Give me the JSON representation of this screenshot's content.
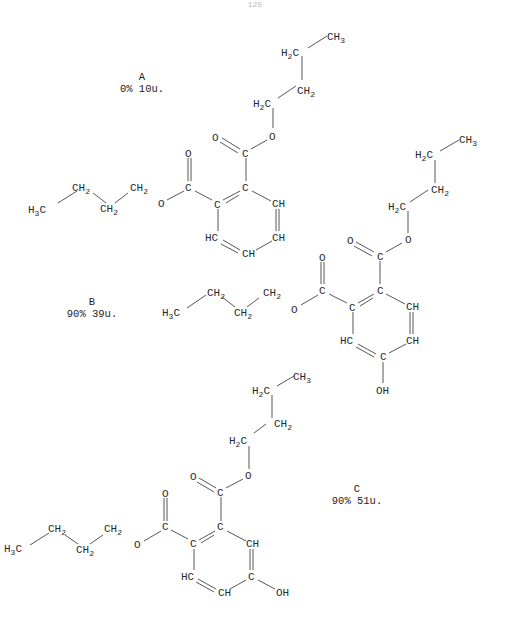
{
  "page_number": "125",
  "compounds": [
    {
      "id": "A",
      "title": "A",
      "caption": "0% 10u.",
      "substituent": "none",
      "atoms": {
        "c_ch3": "CH3",
        "c_h2c_a": "H2C",
        "c_ch2_a": "CH2",
        "c_h2c_b": "H2C",
        "c_o": "O",
        "c_carb": "C",
        "c_carb_o": "O",
        "r1": "C",
        "r2": "C",
        "r3": "CH",
        "r4": "CH",
        "r5": "CH",
        "r6": "HC",
        "l_carb": "C",
        "l_carb_o": "O",
        "l_o": "O",
        "l_ch2_a": "CH2",
        "l_ch2_b": "CH2",
        "l_ch2_c": "CH2",
        "l_ch3": "H3C"
      }
    },
    {
      "id": "B",
      "title": "B",
      "caption": "90% 39u.",
      "substituent": "OH (para to left ester, position 4)",
      "atoms": {
        "c_ch3": "CH3",
        "c_h2c_a": "H2C",
        "c_ch2_a": "CH2",
        "c_h2c_b": "H2C",
        "c_o": "O",
        "c_carb": "C",
        "c_carb_o": "O",
        "r1": "C",
        "r2": "C",
        "r3": "CH",
        "r4": "CH",
        "r5": "C",
        "r6": "HC",
        "oh": "OH",
        "l_carb": "C",
        "l_carb_o": "O",
        "l_o": "O",
        "l_ch2_a": "CH2",
        "l_ch2_b": "CH2",
        "l_ch2_c": "CH2",
        "l_ch3": "H3C"
      }
    },
    {
      "id": "C",
      "title": "C",
      "caption": "90% 51u.",
      "substituent": "OH (position 5)",
      "atoms": {
        "c_ch3": "CH3",
        "c_h2c_a": "H2C",
        "c_ch2_a": "CH2",
        "c_h2c_b": "H2C",
        "c_o": "O",
        "c_carb": "C",
        "c_carb_o": "O",
        "r1": "C",
        "r2": "C",
        "r3": "CH",
        "r4": "C",
        "r5": "CH",
        "r6": "HC",
        "oh": "OH",
        "l_carb": "C",
        "l_carb_o": "O",
        "l_o": "O",
        "l_ch2_a": "CH2",
        "l_ch2_b": "CH2",
        "l_ch2_c": "CH2",
        "l_ch3": "H3C"
      }
    }
  ]
}
